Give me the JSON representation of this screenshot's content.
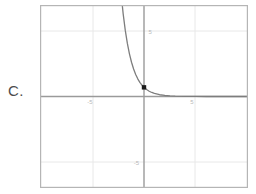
{
  "item": {
    "letter": "C."
  },
  "chart_data": {
    "type": "line",
    "title": "",
    "subtitle": "",
    "xlabel": "",
    "ylabel": "",
    "xlim": [
      -10,
      10
    ],
    "ylim": [
      -10,
      10
    ],
    "grid": true,
    "grid_step": 5,
    "legend": "none",
    "axes": {
      "x_axis_at_y": 0,
      "y_axis_at_x": 0,
      "show_axes": true
    },
    "xticks": [
      -5,
      5
    ],
    "xtick_labels": [
      "-5",
      "5"
    ],
    "yticks": [
      5,
      -5
    ],
    "ytick_labels": [
      "5",
      "-5"
    ],
    "series": [
      {
        "name": "exponential decay",
        "expression": "y = (1/3)^x",
        "color": "#7d7d7d",
        "line_width": 1.3,
        "x": [
          -3.0,
          -2.8,
          -2.6,
          -2.4,
          -2.2,
          -2.0,
          -1.8,
          -1.6,
          -1.4,
          -1.2,
          -1.0,
          -0.8,
          -0.6,
          -0.4,
          -0.2,
          0.0,
          0.25,
          0.5,
          0.75,
          1.0,
          1.5,
          2.0,
          2.5,
          3.0,
          4.0,
          5.0,
          6.0,
          7.0,
          8.0,
          9.0,
          10.0
        ],
        "y": [
          27.0,
          21.67,
          17.39,
          13.96,
          11.21,
          9.0,
          7.22,
          5.8,
          4.66,
          3.74,
          3.0,
          2.41,
          1.93,
          1.55,
          1.25,
          1.0,
          0.76,
          0.577,
          0.439,
          0.333,
          0.192,
          0.111,
          0.064,
          0.037,
          0.0123,
          0.0041,
          0.0014,
          0.00046,
          0.00015,
          5e-05,
          1.7e-05
        ]
      }
    ],
    "markers": [
      {
        "name": "y-intercept",
        "shape": "square",
        "x": 0,
        "y": 1,
        "color": "#1a1a1a",
        "size": 4
      }
    ],
    "annotations": []
  },
  "style": {
    "frame_color": "#b3b3b3",
    "grid_color": "#e6e6e6",
    "axis_color": "#999999",
    "curve_color": "#7d7d7d",
    "marker_color": "#1a1a1a",
    "tick_label_color": "#b9b9b9",
    "label_color": "#4c4c4c",
    "background": "#ffffff"
  }
}
